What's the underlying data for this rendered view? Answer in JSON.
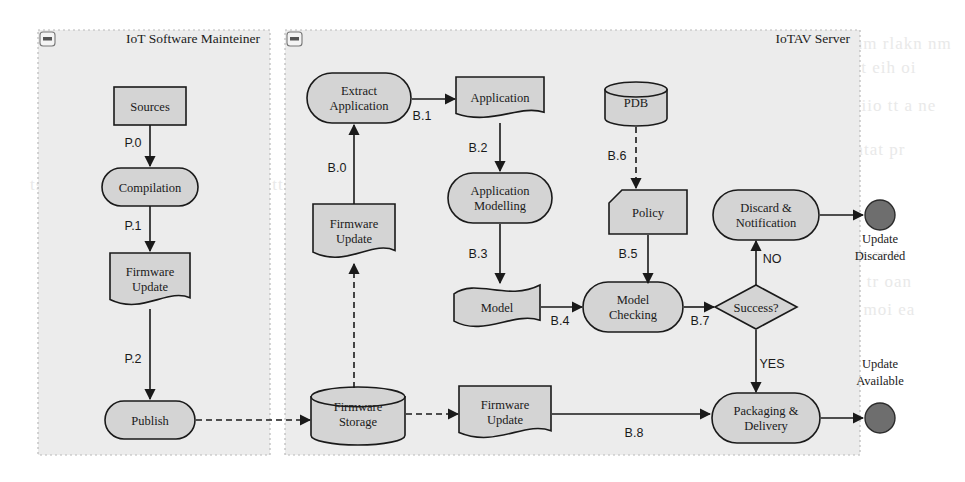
{
  "diagram": {
    "colors": {
      "pane_fill": "#ececec",
      "pane_border": "#b9b9b9",
      "node_fill": "#d4d4d4",
      "node_stroke": "#1a1a1a",
      "edge": "#1a1a1a",
      "end_node_fill": "#6e6e6e",
      "background": "#ffffff"
    },
    "panes": [
      {
        "id": "maintainer",
        "title": "IoT Software Mainteiner",
        "icon": "minimize-icon",
        "x": 38,
        "y": 30,
        "w": 232,
        "h": 425
      },
      {
        "id": "server",
        "title": "IoTAV Server",
        "icon": "minimize-icon",
        "x": 285,
        "y": 30,
        "w": 575,
        "h": 425
      }
    ],
    "nodes": [
      {
        "id": "sources",
        "label": "Sources",
        "shape": "rect",
        "cx": 150,
        "cy": 106,
        "w": 72,
        "h": 38
      },
      {
        "id": "compilation",
        "label": "Compilation",
        "shape": "rounded",
        "cx": 150,
        "cy": 187,
        "w": 96,
        "h": 38
      },
      {
        "id": "fw_update_l",
        "label": "Firmware\nUpdate",
        "shape": "document",
        "cx": 150,
        "cy": 281,
        "w": 80,
        "h": 56
      },
      {
        "id": "publish",
        "label": "Publish",
        "shape": "rounded",
        "cx": 150,
        "cy": 420,
        "w": 90,
        "h": 38
      },
      {
        "id": "extract_app",
        "label": "Extract\nApplication",
        "shape": "rounded",
        "cx": 359,
        "cy": 98,
        "w": 104,
        "h": 50
      },
      {
        "id": "application",
        "label": "Application",
        "shape": "document",
        "cx": 500,
        "cy": 99,
        "w": 88,
        "h": 44
      },
      {
        "id": "app_model",
        "label": "Application\nModelling",
        "shape": "rounded",
        "cx": 500,
        "cy": 198,
        "w": 104,
        "h": 50
      },
      {
        "id": "model",
        "label": "Model",
        "shape": "wave",
        "cx": 497,
        "cy": 307,
        "w": 86,
        "h": 44
      },
      {
        "id": "pdb",
        "label": "PDB",
        "shape": "cylinder",
        "cx": 636,
        "cy": 104,
        "w": 62,
        "h": 44
      },
      {
        "id": "policy",
        "label": "Policy",
        "shape": "cutrect",
        "cx": 648,
        "cy": 212,
        "w": 78,
        "h": 44
      },
      {
        "id": "model_check",
        "label": "Model\nChecking",
        "shape": "rounded",
        "cx": 633,
        "cy": 307,
        "w": 100,
        "h": 50
      },
      {
        "id": "success",
        "label": "Success?",
        "shape": "diamond",
        "cx": 756,
        "cy": 307,
        "w": 82,
        "h": 44
      },
      {
        "id": "discard",
        "label": "Discard &\nNotification",
        "shape": "rounded",
        "cx": 766,
        "cy": 215,
        "w": 106,
        "h": 50
      },
      {
        "id": "fw_update_m",
        "label": "Firmware\nUpdate",
        "shape": "document",
        "cx": 354,
        "cy": 233,
        "w": 82,
        "h": 58
      },
      {
        "id": "fw_storage",
        "label": "Firmware\nStorage",
        "shape": "cylinder",
        "cx": 358,
        "cy": 416,
        "w": 94,
        "h": 58
      },
      {
        "id": "fw_update_b",
        "label": "Firmware\nUpdate",
        "shape": "document",
        "cx": 505,
        "cy": 414,
        "w": 92,
        "h": 56
      },
      {
        "id": "packaging",
        "label": "Packaging &\nDelivery",
        "shape": "rounded",
        "cx": 766,
        "cy": 418,
        "w": 108,
        "h": 50
      },
      {
        "id": "end_discard",
        "label": "",
        "shape": "endnode",
        "cx": 880,
        "cy": 215,
        "r": 15
      },
      {
        "id": "end_avail",
        "label": "",
        "shape": "endnode",
        "cx": 880,
        "cy": 418,
        "r": 15
      }
    ],
    "end_labels": [
      {
        "id": "update-discarded-label",
        "lines": [
          "Update",
          "Discarded"
        ],
        "cx": 880,
        "cy": 243
      },
      {
        "id": "update-available-label",
        "lines": [
          "Update",
          "Available"
        ],
        "cx": 880,
        "cy": 368
      }
    ],
    "edges": [
      {
        "id": "p0",
        "label": "P.0",
        "from": "sources",
        "to": "compilation",
        "style": "solid",
        "lx": 133,
        "ly": 147
      },
      {
        "id": "p1",
        "label": "P.1",
        "from": "compilation",
        "to": "fw_update_l",
        "style": "solid",
        "lx": 133,
        "ly": 230
      },
      {
        "id": "p2",
        "label": "P.2",
        "from": "fw_update_l",
        "to": "publish",
        "style": "solid",
        "lx": 133,
        "ly": 363
      },
      {
        "id": "pub_store",
        "label": "",
        "from": "publish",
        "to": "fw_storage",
        "style": "dashed"
      },
      {
        "id": "b0",
        "label": "B.0",
        "from": "fw_update_m",
        "to": "extract_app",
        "style": "solid",
        "lx": 337,
        "ly": 172
      },
      {
        "id": "b1",
        "label": "B.1",
        "from": "extract_app",
        "to": "application",
        "style": "solid",
        "lx": 422,
        "ly": 120
      },
      {
        "id": "b2",
        "label": "B.2",
        "from": "application",
        "to": "app_model",
        "style": "solid",
        "lx": 478,
        "ly": 152
      },
      {
        "id": "b3",
        "label": "B.3",
        "from": "app_model",
        "to": "model",
        "style": "solid",
        "lx": 478,
        "ly": 258
      },
      {
        "id": "b4",
        "label": "B.4",
        "from": "model",
        "to": "model_check",
        "style": "solid",
        "lx": 560,
        "ly": 325
      },
      {
        "id": "b5",
        "label": "B.5",
        "from": "policy",
        "to": "model_check",
        "style": "solid",
        "lx": 628,
        "ly": 258
      },
      {
        "id": "b6",
        "label": "B.6",
        "from": "pdb",
        "to": "policy",
        "style": "dashed",
        "lx": 617,
        "ly": 160
      },
      {
        "id": "b7",
        "label": "B.7",
        "from": "model_check",
        "to": "success",
        "style": "solid",
        "lx": 700,
        "ly": 325
      },
      {
        "id": "b8",
        "label": "B.8",
        "from": "fw_update_b",
        "to": "packaging",
        "style": "solid",
        "lx": 634,
        "ly": 437
      },
      {
        "id": "no",
        "label": "NO",
        "from": "success",
        "to": "discard",
        "style": "solid",
        "lx": 772,
        "ly": 263
      },
      {
        "id": "yes",
        "label": "YES",
        "from": "success",
        "to": "packaging",
        "style": "solid",
        "lx": 772,
        "ly": 368
      },
      {
        "id": "store_fwupd",
        "label": "",
        "from": "fw_storage",
        "to": "fw_update_b",
        "style": "dashed"
      },
      {
        "id": "store_fwupdm",
        "label": "",
        "from": "fw_storage",
        "to": "fw_update_m",
        "style": "dashed"
      },
      {
        "id": "discard_end",
        "label": "",
        "from": "discard",
        "to": "end_discard",
        "style": "solid"
      },
      {
        "id": "pack_end",
        "label": "",
        "from": "packaging",
        "to": "end_avail",
        "style": "solid"
      }
    ],
    "background_text": [
      "ernai ypsxh den. Tae inyjprevptcnm rlakn nm",
      "nf tinla atatve ntodes gisti a ta nnt eih oi",
      "sa tanm hr saad eatme tahs ta n atiio tt a ne",
      "si tia mof eranto sea ot r toah tn  ntat pr",
      "tso arpp tan ta eas ttsa an te ot ttsae si o",
      "nt aos rp tatn aeto s ttns ra ti oa tn arst",
      "n eitr amni oe ttsa pr oatn sta emi tr oan",
      "ttsa er minot ap rs tn aoe it sta rn moi ea"
    ]
  }
}
